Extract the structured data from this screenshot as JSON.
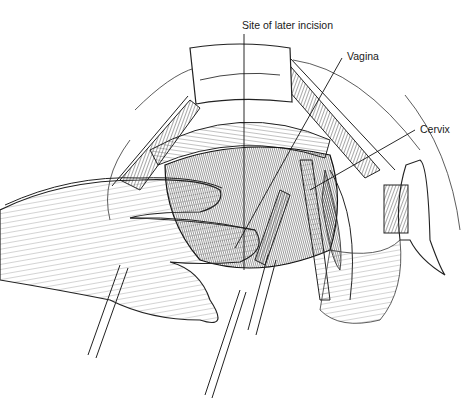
{
  "figure": {
    "type": "surgical line illustration",
    "background": "#ffffff",
    "ink_color": "#1a1a1a"
  },
  "labels": [
    {
      "id": "incision",
      "text": "Site of later incision",
      "x": 242,
      "y": 20
    },
    {
      "id": "vagina",
      "text": "Vagina",
      "x": 347,
      "y": 51
    },
    {
      "id": "cervix",
      "text": "Cervix",
      "x": 420,
      "y": 124
    }
  ]
}
